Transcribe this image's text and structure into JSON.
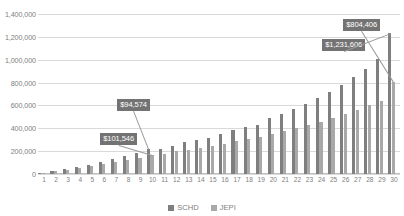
{
  "chart_data": {
    "type": "bar",
    "title": "",
    "subtitle": "",
    "xlabel": "",
    "ylabel": "",
    "ylim": [
      0,
      1400000
    ],
    "ytick_labels": [
      "0",
      "200,000",
      "400,000",
      "600,000",
      "800,000",
      "1,000,000",
      "1,200,000",
      "1,400,000"
    ],
    "ytick_values": [
      0,
      200000,
      400000,
      600000,
      800000,
      1000000,
      1200000,
      1400000
    ],
    "grid": true,
    "legend_position": "bottom",
    "categories": [
      1,
      2,
      3,
      4,
      5,
      6,
      7,
      8,
      9,
      10,
      11,
      12,
      13,
      14,
      15,
      16,
      17,
      18,
      19,
      20,
      21,
      22,
      23,
      24,
      25,
      26,
      27,
      28,
      29,
      30
    ],
    "series": [
      {
        "name": "SCHD",
        "color": "#7f7f7f",
        "values": [
          13000,
          28000,
          44000,
          62000,
          82000,
          104000,
          128000,
          155000,
          184000,
          216000,
          219000,
          248000,
          276000,
          300000,
          316000,
          352000,
          381000,
          413000,
          433000,
          486000,
          525000,
          565000,
          612000,
          664000,
          718000,
          780000,
          848000,
          922000,
          1005000,
          1231606
        ]
      },
      {
        "name": "JEPI",
        "color": "#a9a9a9",
        "values": [
          12000,
          25000,
          39000,
          54000,
          70000,
          87000,
          105000,
          124000,
          144000,
          165000,
          178000,
          198000,
          214000,
          230000,
          242000,
          266000,
          286000,
          308000,
          320000,
          352000,
          376000,
          400000,
          428000,
          458000,
          490000,
          524000,
          560000,
          600000,
          642000,
          804406
        ]
      }
    ],
    "annotations": [
      {
        "label": "$101,546",
        "x": 10,
        "series": "JEPI",
        "box_left": 100,
        "box_top": 133
      },
      {
        "label": "$94,574",
        "x": 10,
        "series": "SCHD",
        "box_left": 117,
        "box_top": 99
      },
      {
        "label": "$1,231,606",
        "x": 30,
        "series": "SCHD",
        "box_left": 322,
        "box_top": 39
      },
      {
        "label": "$804,406",
        "x": 30,
        "series": "JEPI",
        "box_left": 343,
        "box_top": 19
      }
    ]
  },
  "legend": {
    "items": [
      {
        "label": "SCHD",
        "color": "#7f7f7f"
      },
      {
        "label": "JEPI",
        "color": "#a9a9a9"
      }
    ]
  }
}
